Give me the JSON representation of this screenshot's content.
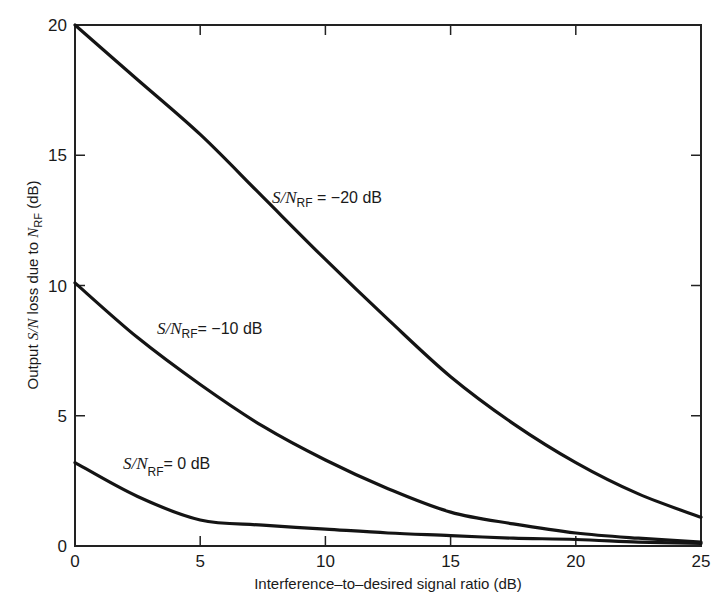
{
  "chart_data": {
    "type": "line",
    "title": "",
    "xlabel": "Interference–to–desired signal ratio (dB)",
    "ylabel": "Output S/N loss due to N_RF (dB)",
    "xlim": [
      0,
      25
    ],
    "ylim": [
      0,
      20
    ],
    "xticks": [
      0,
      5,
      10,
      15,
      20,
      25
    ],
    "yticks": [
      0,
      5,
      10,
      15,
      20
    ],
    "grid": false,
    "legend": "inline curve labels",
    "x": [
      0,
      2.5,
      5,
      7.5,
      10,
      12.5,
      15,
      17.5,
      20,
      22.5,
      25
    ],
    "series": [
      {
        "name": "S/N_RF = −20 dB",
        "label_main": "S/N",
        "label_sub": "RF",
        "label_value": " = −20 dB",
        "values": [
          20.0,
          17.9,
          15.8,
          13.4,
          11.0,
          8.7,
          6.5,
          4.7,
          3.2,
          2.0,
          1.1
        ]
      },
      {
        "name": "S/N_RF = −10 dB",
        "label_main": "S/N",
        "label_sub": "RF",
        "label_value": "= −10 dB",
        "values": [
          10.1,
          8.0,
          6.2,
          4.6,
          3.3,
          2.2,
          1.3,
          0.85,
          0.5,
          0.3,
          0.15
        ]
      },
      {
        "name": "S/N_RF = 0 dB",
        "label_main": "S/N",
        "label_sub": "RF",
        "label_value": "= 0 dB",
        "values": [
          3.2,
          1.9,
          1.0,
          0.8,
          0.65,
          0.5,
          0.4,
          0.3,
          0.25,
          0.15,
          0.1
        ]
      }
    ]
  },
  "axes": {
    "xlabel": "Interference–to–desired signal ratio (dB)",
    "ylabel_prefix": "Output ",
    "ylabel_italic": "S/N",
    "ylabel_mid": " loss due to ",
    "ylabel_italic2": "N",
    "ylabel_sub": "RF",
    "ylabel_suffix": "  (dB)"
  }
}
